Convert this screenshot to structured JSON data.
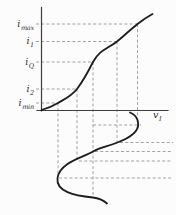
{
  "canvas": {
    "width": 176,
    "height": 215
  },
  "colors": {
    "background": "#fcfcfc",
    "axis": "#3d3d3d",
    "curve": "#1c1c1c",
    "guide": "#979797",
    "text": "#2e2e2e"
  },
  "labels": {
    "y_levels": [
      {
        "base": "i",
        "sub": "max"
      },
      {
        "base": "i",
        "sub": "1"
      },
      {
        "base": "i",
        "sub": "Q"
      },
      {
        "base": "i",
        "sub": "2"
      },
      {
        "base": "i",
        "sub": "min"
      }
    ],
    "x_axis": {
      "base": "v",
      "sub": "I"
    }
  },
  "chart_data": {
    "type": "line",
    "title": "",
    "xlabel": "v_I",
    "ylabel": "",
    "grid": false,
    "legend": false,
    "numeric_ticks": false,
    "y_level_guides": [
      {
        "label": "i_max",
        "y_px": 24,
        "curve_x_px": 137.5
      },
      {
        "label": "i_1",
        "y_px": 41.5,
        "curve_x_px": 117
      },
      {
        "label": "i_Q",
        "y_px": 62,
        "curve_x_px": 93
      },
      {
        "label": "i_2",
        "y_px": 89,
        "curve_x_px": 77
      },
      {
        "label": "i_min",
        "y_px": 103,
        "curve_x_px": 58
      }
    ],
    "series": [
      {
        "name": "transfer characteristic i vs v_I (S-shaped, origin to saturation)",
        "points_px": [
          [
            41.5,
            110
          ],
          [
            58,
            103
          ],
          [
            77,
            89
          ],
          [
            93,
            62
          ],
          [
            117,
            41.5
          ],
          [
            137.5,
            24
          ],
          [
            152.5,
            14
          ]
        ]
      },
      {
        "name": "input sinusoid vs time, time axis downward along v_Q vertical",
        "points_px": [
          [
            130,
            112.5
          ],
          [
            138,
            124
          ],
          [
            117.5,
            142.5
          ],
          [
            93,
            151.5
          ],
          [
            57.5,
            178
          ],
          [
            93,
            197.5
          ],
          [
            107,
            203.5
          ]
        ]
      }
    ],
    "time_instant_guides_y_px": [
      125,
      142.5,
      151.5,
      161,
      178
    ],
    "input_level_verticals_x_px": [
      58,
      77,
      93,
      117,
      137.5
    ]
  },
  "svg": {
    "axes": [
      {
        "name": "y-axis",
        "x1": 41.5,
        "y1": 7.5,
        "x2": 41.5,
        "y2": 111
      },
      {
        "name": "x-axis",
        "x1": 37,
        "y1": 110.5,
        "x2": 168,
        "y2": 110.5
      }
    ],
    "curves": [
      {
        "name": "transfer-curve",
        "d": "M 41.5 110 C 47 108.5 52.5 106.3 58 103 C 64 99.4 71.5 96.2 77 89 C 82 82.4 87.5 73 93 62 C 99 50 109 48 117 41.5 C 123 36.6 130 30 137.5 24 C 142.5 20 148 16.5 152.5 14"
      },
      {
        "name": "input-waveform",
        "d": "M 130 112.5 C 135.5 114.5 138 118.5 138.2 124 C 138.5 132 128 138.5 117.5 142.5 C 106 147 99.5 147.7 93 151.5 C 82 158 59.5 162.5 57.5 178 C 55.8 191.5 74 195.5 93 197.5 C 99.5 198.2 103.5 200.5 107 203.5"
      }
    ],
    "guides": [
      {
        "name": "guide-h-imax",
        "x1": 36,
        "y1": 24,
        "x2": 138,
        "y2": 24
      },
      {
        "name": "guide-h-i1",
        "x1": 36,
        "y1": 41.5,
        "x2": 117,
        "y2": 41.5
      },
      {
        "name": "guide-h-iq",
        "x1": 36,
        "y1": 62,
        "x2": 93,
        "y2": 62
      },
      {
        "name": "guide-h-i2",
        "x1": 36,
        "y1": 89,
        "x2": 77,
        "y2": 89
      },
      {
        "name": "guide-h-imin",
        "x1": 36,
        "y1": 103,
        "x2": 58,
        "y2": 103
      },
      {
        "name": "guide-v-vmax",
        "x1": 137.5,
        "y1": 24,
        "x2": 137.5,
        "y2": 122
      },
      {
        "name": "guide-v-v1",
        "x1": 117,
        "y1": 41.5,
        "x2": 117,
        "y2": 142.5
      },
      {
        "name": "guide-v-vq",
        "x1": 93,
        "y1": 62,
        "x2": 93,
        "y2": 196
      },
      {
        "name": "guide-v-v2",
        "x1": 77,
        "y1": 89,
        "x2": 77,
        "y2": 160
      },
      {
        "name": "guide-v-vmin",
        "x1": 58,
        "y1": 103,
        "x2": 58,
        "y2": 177
      },
      {
        "name": "guide-t-peak",
        "x1": 93,
        "y1": 125,
        "x2": 141,
        "y2": 125
      },
      {
        "name": "guide-t-i1",
        "x1": 120,
        "y1": 142.5,
        "x2": 173,
        "y2": 142.5
      },
      {
        "name": "guide-t-zero",
        "x1": 95,
        "y1": 151.5,
        "x2": 173,
        "y2": 151.5
      },
      {
        "name": "guide-t-i2",
        "x1": 79,
        "y1": 161,
        "x2": 172,
        "y2": 161
      },
      {
        "name": "guide-t-trough",
        "x1": 59,
        "y1": 178,
        "x2": 173,
        "y2": 178
      }
    ]
  }
}
